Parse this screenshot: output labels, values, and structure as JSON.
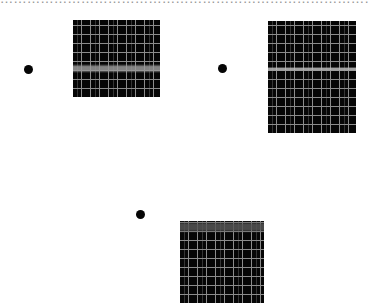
{
  "header": {
    "cropped_text": "………………………………………………………………………………………"
  },
  "stimuli": [
    {
      "id": "panel-1",
      "dot": {
        "x": 24,
        "y": 65
      },
      "grid": {
        "x": 73,
        "y": 20,
        "width": 87,
        "height": 77
      },
      "band": {
        "top": 44,
        "height": 9,
        "color": "#9a9a9a"
      },
      "line_color": "#8c8c8c",
      "spacing": 9
    },
    {
      "id": "panel-2",
      "dot": {
        "x": 218,
        "y": 64
      },
      "grid": {
        "x": 268,
        "y": 21,
        "width": 88,
        "height": 112
      },
      "band": {
        "top": 46,
        "height": 4,
        "color": "#bdbdbd"
      },
      "line_color": "#8c8c8c",
      "spacing": 9
    },
    {
      "id": "panel-3",
      "dot": {
        "x": 136,
        "y": 210
      },
      "grid": {
        "x": 180,
        "y": 221,
        "width": 84,
        "height": 82
      },
      "band": {
        "top": 0,
        "height": 12,
        "color": "#555555"
      },
      "line_color": "#8c8c8c",
      "spacing": 9
    }
  ],
  "colors": {
    "background": "#ffffff",
    "grid_fill": "#060606",
    "dot": "#050505"
  }
}
